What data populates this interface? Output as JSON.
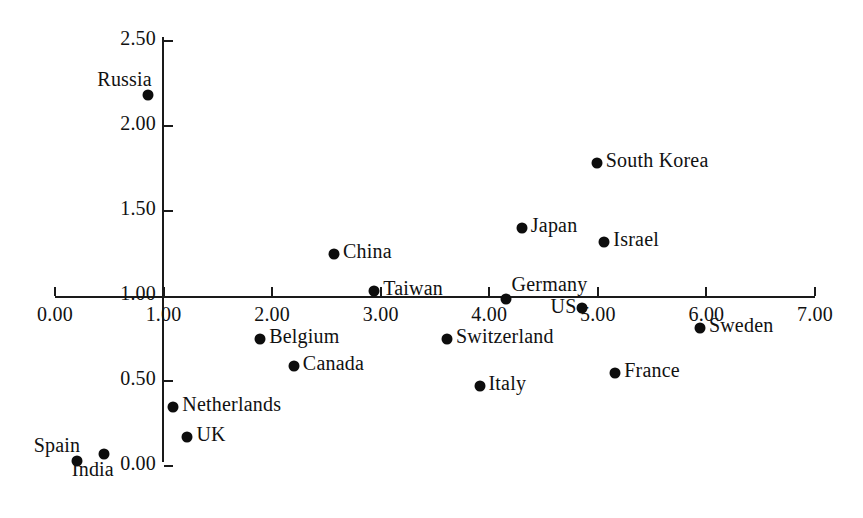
{
  "chart_data": {
    "type": "scatter",
    "title": "",
    "subtitle": "",
    "xlabel": "",
    "ylabel": "",
    "xlim": [
      0.0,
      7.0
    ],
    "ylim": [
      0.0,
      2.5
    ],
    "grid": false,
    "legend": "none",
    "x_ticks": [
      "0.00",
      "1.00",
      "2.00",
      "3.00",
      "4.00",
      "5.00",
      "6.00",
      "7.00"
    ],
    "x_tick_values": [
      0.0,
      1.0,
      2.0,
      3.0,
      4.0,
      5.0,
      6.0,
      7.0
    ],
    "y_ticks": [
      "0.00",
      "0.50",
      "1.00",
      "1.50",
      "2.00",
      "2.50"
    ],
    "y_tick_values": [
      0.0,
      0.5,
      1.0,
      1.5,
      2.0,
      2.5
    ],
    "x_axis_crosses_y_at": 1.0,
    "y_axis_crosses_x_at": 1.0,
    "marker": "filled-circle",
    "marker_color": "#0d0d0d",
    "axis_color": "#1a1a1a",
    "points": [
      {
        "label": "Russia",
        "x": 0.86,
        "y": 2.18,
        "label_pos": "above-left"
      },
      {
        "label": "South Korea",
        "x": 4.99,
        "y": 1.78,
        "label_pos": "right"
      },
      {
        "label": "Japan",
        "x": 4.3,
        "y": 1.4,
        "label_pos": "right"
      },
      {
        "label": "Israel",
        "x": 5.06,
        "y": 1.32,
        "label_pos": "right"
      },
      {
        "label": "China",
        "x": 2.57,
        "y": 1.25,
        "label_pos": "right"
      },
      {
        "label": "Taiwan",
        "x": 2.94,
        "y": 1.03,
        "label_pos": "right"
      },
      {
        "label": "Germany",
        "x": 4.15,
        "y": 0.98,
        "label_pos": "above-right"
      },
      {
        "label": "US",
        "x": 4.85,
        "y": 0.93,
        "label_pos": "left"
      },
      {
        "label": "Sweden",
        "x": 5.94,
        "y": 0.81,
        "label_pos": "right"
      },
      {
        "label": "Belgium",
        "x": 1.89,
        "y": 0.75,
        "label_pos": "right"
      },
      {
        "label": "Switzerland",
        "x": 3.61,
        "y": 0.75,
        "label_pos": "right"
      },
      {
        "label": "Canada",
        "x": 2.2,
        "y": 0.59,
        "label_pos": "right"
      },
      {
        "label": "France",
        "x": 5.16,
        "y": 0.55,
        "label_pos": "right"
      },
      {
        "label": "Italy",
        "x": 3.91,
        "y": 0.47,
        "label_pos": "right"
      },
      {
        "label": "Netherlands",
        "x": 1.09,
        "y": 0.35,
        "label_pos": "right"
      },
      {
        "label": "UK",
        "x": 1.22,
        "y": 0.17,
        "label_pos": "right"
      },
      {
        "label": "India",
        "x": 0.45,
        "y": 0.07,
        "label_pos": "below-left"
      },
      {
        "label": "Spain",
        "x": 0.2,
        "y": 0.03,
        "label_pos": "above-left"
      }
    ]
  }
}
